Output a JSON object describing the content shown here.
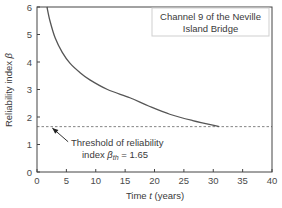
{
  "chart_data": {
    "type": "line",
    "title": "",
    "xlabel": "Time t (years)",
    "xlabel_parts": {
      "prefix": "Time ",
      "var": "t",
      "suffix": " (years)"
    },
    "ylabel": "Reliability index β",
    "ylabel_parts": {
      "prefix": "Reliability index ",
      "var": "β"
    },
    "xlim": [
      0,
      40
    ],
    "ylim": [
      0,
      6
    ],
    "x_ticks": [
      0,
      5,
      10,
      15,
      20,
      25,
      30,
      35,
      40
    ],
    "y_ticks": [
      0,
      1,
      2,
      3,
      4,
      5,
      6
    ],
    "grid": false,
    "legend": {
      "position": "upper right",
      "lines": [
        "Channel 9 of the Neville",
        "Island Bridge"
      ]
    },
    "series": [
      {
        "name": "Channel 9 of the Neville Island Bridge",
        "color": "#555555",
        "x": [
          1.7,
          2.2,
          3.1,
          4.3,
          5.6,
          7.3,
          9.0,
          12.0,
          15.8,
          19.0,
          22.6,
          26.5,
          31.0
        ],
        "y": [
          6.0,
          5.5,
          4.87,
          4.35,
          3.96,
          3.62,
          3.35,
          3.0,
          2.7,
          2.4,
          2.1,
          1.87,
          1.65
        ]
      }
    ],
    "reference_lines": [
      {
        "axis": "y",
        "value": 1.65,
        "style": "dashed",
        "color": "#666666",
        "label": "Threshold of reliability index βth = 1.65"
      }
    ],
    "annotations": [
      {
        "text_line1": "Threshold of reliability",
        "text_line2_prefix": "index ",
        "text_line2_var": "β",
        "text_line2_sub": "th",
        "text_line2_suffix": " = 1.65",
        "arrow_from": [
          5.3,
          1.1
        ],
        "arrow_to": [
          2.6,
          1.6
        ]
      }
    ]
  }
}
